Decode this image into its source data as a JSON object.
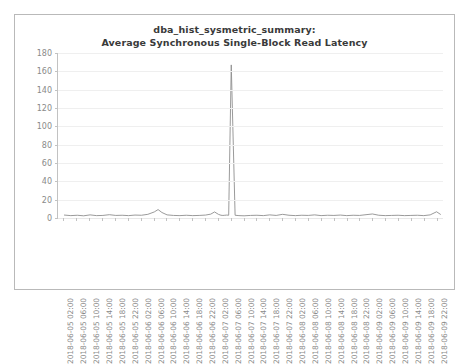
{
  "chart": {
    "title_line1": "dba_hist_sysmetric_summary:",
    "title_line2": "Average Synchronous Single-Block Read Latency"
  },
  "chart_data": {
    "type": "line",
    "title": "dba_hist_sysmetric_summary: Average Synchronous Single-Block Read Latency",
    "xlabel": "",
    "ylabel": "",
    "ylim": [
      0,
      180
    ],
    "yticks": [
      0,
      20,
      40,
      60,
      80,
      100,
      120,
      140,
      160,
      180
    ],
    "grid": true,
    "legend": null,
    "line_color": "#8f8f8f",
    "categories": [
      "2018-06-05 02:00",
      "2018-06-05 06:00",
      "2018-06-05 10:00",
      "2018-06-05 14:00",
      "2018-06-05 18:00",
      "2018-06-05 22:00",
      "2018-06-06 02:00",
      "2018-06-06 06:00",
      "2018-06-06 10:00",
      "2018-06-06 14:00",
      "2018-06-06 18:00",
      "2018-06-06 22:00",
      "2018-06-07 02:00",
      "2018-06-07 06:00",
      "2018-06-07 10:00",
      "2018-06-07 14:00",
      "2018-06-07 18:00",
      "2018-06-07 22:00",
      "2018-06-08 02:00",
      "2018-06-08 06:00",
      "2018-06-08 10:00",
      "2018-06-08 14:00",
      "2018-06-08 18:00",
      "2018-06-08 22:00",
      "2018-06-09 02:00",
      "2018-06-09 06:00",
      "2018-06-09 10:00",
      "2018-06-09 14:00",
      "2018-06-09 18:00",
      "2018-06-09 22:00"
    ],
    "series": [
      {
        "name": "Average Synchronous Single-Block Read Latency",
        "x": [
          0,
          0.5,
          1,
          1.5,
          2,
          2.5,
          3,
          3.5,
          4,
          4.5,
          5,
          5.5,
          6,
          6.5,
          7,
          7.3,
          7.6,
          8,
          8.5,
          9,
          9.5,
          10,
          10.5,
          11,
          11.4,
          11.7,
          12.0,
          12.2,
          12.35,
          12.5,
          12.65,
          12.8,
          13.0,
          13.3,
          13.6,
          14,
          14.5,
          15,
          15.5,
          16,
          16.5,
          17,
          17.5,
          18,
          18.5,
          19,
          19.5,
          20,
          20.5,
          21,
          21.5,
          22,
          22.5,
          23,
          23.5,
          24,
          24.5,
          25,
          25.5,
          26,
          26.5,
          27,
          27.5,
          28,
          28.5,
          29,
          29.3
        ],
        "values": [
          3.2,
          2.6,
          3.0,
          2.4,
          3.4,
          2.6,
          2.8,
          3.6,
          2.8,
          3.0,
          2.6,
          3.2,
          3.0,
          4.0,
          6.6,
          9.2,
          6.0,
          3.4,
          2.8,
          2.6,
          3.0,
          2.6,
          2.8,
          3.2,
          4.2,
          6.6,
          4.0,
          3.0,
          2.8,
          3.0,
          3.2,
          3.0,
          167.0,
          3.0,
          2.6,
          2.4,
          2.8,
          3.0,
          2.6,
          3.4,
          2.8,
          4.0,
          3.0,
          2.6,
          3.0,
          2.8,
          3.4,
          2.6,
          3.0,
          2.8,
          3.2,
          2.6,
          3.0,
          2.8,
          3.6,
          4.4,
          3.0,
          2.6,
          2.8,
          3.0,
          2.6,
          2.8,
          3.0,
          2.6,
          3.4,
          6.8,
          4.0
        ]
      }
    ],
    "peak": {
      "value": 167.0,
      "at": "2018-06-07 04:00"
    }
  }
}
